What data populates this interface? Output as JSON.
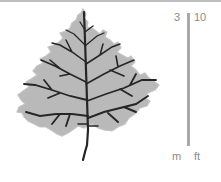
{
  "illustration": {
    "subject": "leaf",
    "fill_color": "#b8b8b8",
    "vein_color": "#222222"
  },
  "scale": {
    "metric_value": "3",
    "imperial_value": "10",
    "metric_unit": "m",
    "imperial_unit": "ft",
    "bar_color": "#a9a9a9"
  }
}
